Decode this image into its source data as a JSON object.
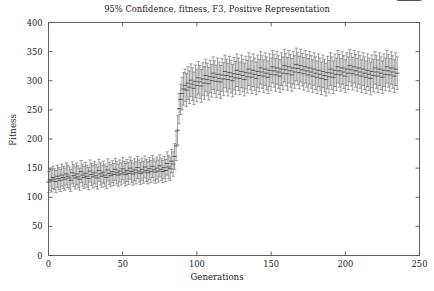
{
  "chart_data": {
    "type": "line",
    "title": "95% Confidence, fitness, F3, Positive Representation",
    "xlabel": "Generations",
    "ylabel": "Fitness",
    "xlim": [
      0,
      250
    ],
    "ylim": [
      0,
      400
    ],
    "xticks": [
      0,
      50,
      100,
      150,
      200,
      250
    ],
    "yticks": [
      0,
      50,
      100,
      150,
      200,
      250,
      300,
      350,
      400
    ],
    "grid": false,
    "legend": null,
    "series_style": "errorbar-95ci",
    "marker_color": "#6e6e6e",
    "frame_color": "#55504c",
    "background": "#ffffff",
    "x": [
      0,
      1,
      2,
      3,
      4,
      5,
      6,
      7,
      8,
      9,
      10,
      11,
      12,
      13,
      14,
      15,
      16,
      17,
      18,
      19,
      20,
      21,
      22,
      23,
      24,
      25,
      26,
      27,
      28,
      29,
      30,
      31,
      32,
      33,
      34,
      35,
      36,
      37,
      38,
      39,
      40,
      41,
      42,
      43,
      44,
      45,
      46,
      47,
      48,
      49,
      50,
      51,
      52,
      53,
      54,
      55,
      56,
      57,
      58,
      59,
      60,
      61,
      62,
      63,
      64,
      65,
      66,
      67,
      68,
      69,
      70,
      71,
      72,
      73,
      74,
      75,
      76,
      77,
      78,
      79,
      80,
      81,
      82,
      83,
      84,
      85,
      86,
      87,
      88,
      89,
      90,
      91,
      92,
      93,
      94,
      95,
      96,
      97,
      98,
      99,
      100,
      101,
      102,
      103,
      104,
      105,
      106,
      107,
      108,
      109,
      110,
      111,
      112,
      113,
      114,
      115,
      116,
      117,
      118,
      119,
      120,
      121,
      122,
      123,
      124,
      125,
      126,
      127,
      128,
      129,
      130,
      131,
      132,
      133,
      134,
      135,
      136,
      137,
      138,
      139,
      140,
      141,
      142,
      143,
      144,
      145,
      146,
      147,
      148,
      149,
      150,
      151,
      152,
      153,
      154,
      155,
      156,
      157,
      158,
      159,
      160,
      161,
      162,
      163,
      164,
      165,
      166,
      167,
      168,
      169,
      170,
      171,
      172,
      173,
      174,
      175,
      176,
      177,
      178,
      179,
      180,
      181,
      182,
      183,
      184,
      185,
      186,
      187,
      188,
      189,
      190,
      191,
      192,
      193,
      194,
      195,
      196,
      197,
      198,
      199,
      200,
      201,
      202,
      203,
      204,
      205,
      206,
      207,
      208,
      209,
      210,
      211,
      212,
      213,
      214,
      215,
      216,
      217,
      218,
      219,
      220,
      221,
      222,
      223,
      224,
      225,
      226,
      227,
      228,
      229,
      230,
      231,
      232,
      233,
      234,
      235,
      236,
      237,
      238,
      239,
      240,
      241,
      242,
      243,
      244,
      245,
      246,
      247,
      248,
      249,
      250
    ],
    "mean": [
      126,
      130,
      128,
      134,
      131,
      127,
      136,
      132,
      129,
      138,
      134,
      131,
      140,
      136,
      133,
      129,
      142,
      137,
      133,
      140,
      135,
      131,
      144,
      138,
      134,
      141,
      136,
      132,
      145,
      139,
      135,
      142,
      137,
      133,
      146,
      140,
      136,
      143,
      138,
      134,
      147,
      141,
      137,
      144,
      139,
      148,
      142,
      138,
      145,
      140,
      149,
      143,
      139,
      146,
      141,
      150,
      144,
      140,
      147,
      142,
      151,
      145,
      141,
      148,
      143,
      152,
      146,
      142,
      149,
      144,
      153,
      147,
      143,
      150,
      145,
      154,
      148,
      144,
      151,
      146,
      158,
      152,
      149,
      162,
      157,
      170,
      188,
      215,
      252,
      268,
      278,
      286,
      292,
      284,
      296,
      289,
      301,
      294,
      287,
      299,
      292,
      305,
      298,
      291,
      303,
      296,
      309,
      302,
      295,
      307,
      300,
      313,
      306,
      299,
      311,
      304,
      298,
      310,
      303,
      316,
      309,
      302,
      314,
      307,
      300,
      312,
      305,
      318,
      311,
      304,
      316,
      309,
      302,
      314,
      307,
      320,
      313,
      306,
      318,
      311,
      304,
      316,
      309,
      322,
      315,
      308,
      320,
      313,
      306,
      318,
      311,
      324,
      317,
      310,
      322,
      315,
      308,
      320,
      313,
      326,
      319,
      312,
      324,
      317,
      310,
      322,
      315,
      328,
      321,
      314,
      326,
      319,
      312,
      324,
      317,
      310,
      322,
      315,
      308,
      320,
      313,
      306,
      318,
      311,
      304,
      316,
      309,
      302,
      314,
      307,
      320,
      313,
      306,
      318,
      311,
      324,
      317,
      310,
      322,
      315,
      308,
      320,
      313,
      326,
      319,
      312,
      324,
      317,
      310,
      322,
      315,
      308,
      320,
      313,
      306,
      318,
      311,
      304,
      316,
      309,
      322,
      315,
      308,
      320,
      313,
      306,
      318,
      311,
      324,
      317,
      310,
      322,
      315,
      308,
      320,
      313
    ],
    "ci_lower": [
      108,
      112,
      109,
      115,
      113,
      108,
      117,
      113,
      110,
      119,
      115,
      112,
      121,
      117,
      114,
      110,
      123,
      118,
      114,
      121,
      116,
      112,
      125,
      119,
      115,
      122,
      117,
      113,
      126,
      120,
      116,
      123,
      118,
      114,
      127,
      121,
      117,
      124,
      119,
      115,
      128,
      122,
      118,
      125,
      120,
      129,
      123,
      119,
      126,
      121,
      130,
      124,
      120,
      127,
      122,
      131,
      125,
      121,
      128,
      123,
      132,
      126,
      122,
      129,
      124,
      133,
      127,
      123,
      130,
      125,
      134,
      128,
      124,
      131,
      126,
      135,
      129,
      125,
      132,
      127,
      138,
      132,
      129,
      142,
      136,
      148,
      163,
      190,
      226,
      242,
      250,
      258,
      264,
      256,
      268,
      261,
      273,
      266,
      259,
      271,
      264,
      277,
      270,
      263,
      275,
      268,
      281,
      274,
      267,
      279,
      272,
      285,
      278,
      271,
      283,
      276,
      270,
      282,
      275,
      288,
      281,
      274,
      286,
      279,
      272,
      284,
      277,
      290,
      283,
      276,
      288,
      281,
      274,
      286,
      279,
      292,
      285,
      278,
      290,
      283,
      276,
      288,
      281,
      294,
      287,
      280,
      292,
      285,
      278,
      290,
      283,
      296,
      289,
      282,
      294,
      287,
      280,
      292,
      285,
      298,
      291,
      284,
      296,
      289,
      282,
      294,
      287,
      300,
      293,
      286,
      298,
      291,
      284,
      296,
      289,
      282,
      294,
      287,
      280,
      292,
      285,
      278,
      290,
      283,
      276,
      288,
      281,
      274,
      286,
      279,
      292,
      285,
      278,
      290,
      283,
      296,
      289,
      282,
      294,
      287,
      280,
      292,
      285,
      298,
      291,
      284,
      296,
      289,
      282,
      294,
      287,
      280,
      292,
      285,
      278,
      290,
      283,
      276,
      288,
      281,
      294,
      287,
      280,
      292,
      285,
      278,
      290,
      283,
      296,
      289,
      282,
      294,
      287,
      280,
      292,
      285
    ],
    "ci_upper": [
      144,
      148,
      147,
      153,
      149,
      146,
      155,
      151,
      148,
      157,
      153,
      150,
      159,
      155,
      152,
      148,
      161,
      156,
      152,
      159,
      154,
      150,
      163,
      157,
      153,
      160,
      155,
      151,
      164,
      158,
      154,
      161,
      156,
      152,
      165,
      159,
      155,
      162,
      157,
      153,
      166,
      160,
      156,
      163,
      158,
      167,
      161,
      157,
      164,
      159,
      168,
      162,
      158,
      165,
      160,
      169,
      163,
      159,
      166,
      161,
      170,
      164,
      160,
      167,
      162,
      171,
      165,
      161,
      168,
      163,
      172,
      166,
      162,
      169,
      164,
      173,
      167,
      163,
      170,
      165,
      178,
      172,
      169,
      182,
      178,
      192,
      213,
      240,
      278,
      294,
      306,
      314,
      320,
      312,
      324,
      317,
      329,
      322,
      315,
      327,
      320,
      333,
      326,
      319,
      331,
      324,
      337,
      330,
      323,
      335,
      328,
      341,
      334,
      327,
      339,
      332,
      326,
      338,
      331,
      344,
      337,
      330,
      342,
      335,
      328,
      340,
      333,
      346,
      339,
      332,
      344,
      337,
      330,
      342,
      335,
      348,
      341,
      334,
      346,
      339,
      332,
      344,
      337,
      350,
      343,
      336,
      348,
      341,
      334,
      346,
      339,
      352,
      345,
      338,
      350,
      343,
      336,
      348,
      341,
      354,
      347,
      340,
      352,
      345,
      338,
      350,
      343,
      356,
      349,
      342,
      354,
      347,
      340,
      352,
      345,
      338,
      350,
      343,
      336,
      348,
      341,
      334,
      346,
      339,
      332,
      344,
      337,
      330,
      342,
      335,
      348,
      341,
      334,
      346,
      339,
      352,
      345,
      338,
      350,
      343,
      336,
      348,
      341,
      354,
      347,
      340,
      352,
      345,
      338,
      350,
      343,
      336,
      348,
      341,
      334,
      346,
      339,
      332,
      344,
      337,
      350,
      343,
      336,
      348,
      341,
      334,
      346,
      339,
      352,
      345,
      338,
      350,
      343,
      336,
      348,
      341
    ]
  }
}
